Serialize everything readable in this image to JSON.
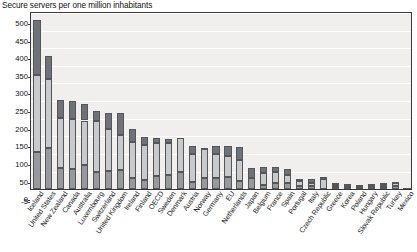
{
  "chart_data": {
    "type": "bar",
    "stacked": true,
    "title": "Secure servers per one million inhabitants",
    "xlabel": "",
    "ylabel": "",
    "ylim": [
      -5,
      500
    ],
    "yticks": [
      -5,
      0,
      50,
      100,
      150,
      200,
      250,
      300,
      350,
      400,
      450,
      500
    ],
    "ytick_labels": [
      "-5",
      "0",
      "50",
      "100",
      "150",
      "200",
      "250",
      "300",
      "350",
      "400",
      "450",
      "500"
    ],
    "grid": true,
    "legend": "none",
    "categories": [
      "Iceland",
      "United States",
      "New Zealand",
      "Canada",
      "Australia",
      "Luxembourg",
      "Switzerland",
      "United Kingdom",
      "Ireland",
      "Finland",
      "OECD",
      "Sweden",
      "Denmark",
      "Austria",
      "Norway",
      "Germany",
      "EU",
      "Netherlands",
      "Japan",
      "Belgium",
      "France",
      "Spain",
      "Portugal",
      "Italy",
      "Czech Republic",
      "Greece",
      "Korea",
      "Poland",
      "Hungary",
      "Slovak Republic",
      "Turkey",
      "Mexico"
    ],
    "series": [
      {
        "name": "lower-segment",
        "values": [
          105,
          116,
          60,
          58,
          70,
          50,
          52,
          55,
          31,
          26,
          37,
          41,
          48,
          21,
          33,
          33,
          34,
          22,
          32,
          12,
          19,
          17,
          8,
          9,
          -11,
          7,
          5,
          5,
          6,
          6,
          9,
          2
        ]
      },
      {
        "name": "middle-segment",
        "values": [
          220,
          198,
          141,
          140,
          125,
          143,
          119,
          100,
          102,
          100,
          95,
          90,
          97,
          80,
          80,
          68,
          60,
          62,
          0,
          35,
          29,
          24,
          14,
          10,
          28,
          6,
          7,
          6,
          6,
          7,
          8,
          1
        ]
      },
      {
        "name": "upper-segment",
        "values": [
          155,
          65,
          53,
          52,
          48,
          29,
          45,
          60,
          37,
          23,
          12,
          12,
          0,
          23,
          5,
          22,
          28,
          35,
          27,
          16,
          14,
          17,
          8,
          10,
          6,
          5,
          2,
          2,
          4,
          5,
          4,
          1
        ]
      }
    ],
    "totals": [
      480,
      379,
      254,
      250,
      243,
      222,
      216,
      215,
      170,
      149,
      144,
      143,
      145,
      124,
      118,
      123,
      122,
      119,
      59,
      63,
      62,
      58,
      30,
      29,
      34,
      18,
      14,
      13,
      16,
      18,
      21,
      4
    ]
  },
  "colors": {
    "plot_background": "#f0efee",
    "gridline": "#ffffff",
    "axis": "#3a3a3a",
    "segment_bottom": "#97999c",
    "segment_middle": "#c9cacb",
    "segment_top": "#6f7277",
    "text": "#1a1a1a"
  }
}
